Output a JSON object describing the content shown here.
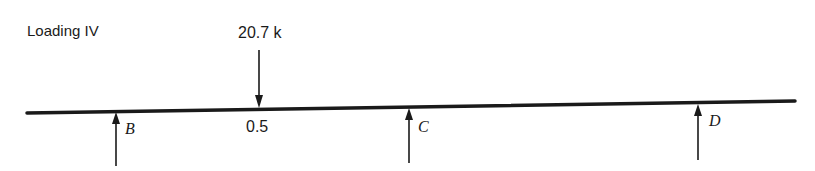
{
  "diagram": {
    "title": "Loading IV",
    "beam": {
      "color": "#1a1a1a"
    },
    "point_load": {
      "value_label": "20.7 k",
      "position_label": "0.5",
      "direction": "down"
    },
    "supports": [
      {
        "label": "B",
        "reaction_direction": "up"
      },
      {
        "label": "C",
        "reaction_direction": "up"
      },
      {
        "label": "D",
        "reaction_direction": "up"
      }
    ]
  }
}
